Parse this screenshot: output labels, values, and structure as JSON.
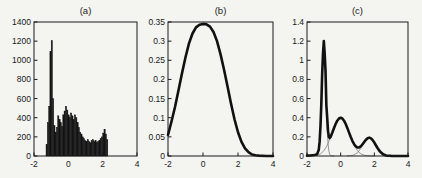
{
  "colors": {
    "paper": "#f4f4f1",
    "ink": "#1a1a1a",
    "bar_fill": "#141414",
    "thick_line": "#111111",
    "thin_line": "#6e6e6e"
  },
  "chart_data": [
    {
      "id": "a",
      "type": "bar",
      "title": "(a)",
      "xlabel": "",
      "ylabel": "",
      "xlim": [
        -2,
        4
      ],
      "ylim": [
        0,
        1400
      ],
      "grid": false,
      "legend": null,
      "xticks": {
        "values": [
          -2,
          0,
          2,
          4
        ],
        "labels": [
          "-2",
          "0",
          "2",
          "4"
        ]
      },
      "yticks": {
        "values": [
          0,
          200,
          400,
          600,
          800,
          1000,
          1200,
          1400
        ],
        "labels": [
          "0",
          "200",
          "400",
          "600",
          "800",
          "1000",
          "1200",
          "1400"
        ]
      },
      "bin_start": -1.3,
      "bin_width": 0.075,
      "values": [
        120,
        350,
        520,
        1090,
        1205,
        600,
        320,
        250,
        300,
        420,
        380,
        350,
        310,
        430,
        470,
        520,
        480,
        430,
        400,
        450,
        420,
        380,
        430,
        400,
        350,
        300,
        250,
        230,
        200,
        180,
        160,
        150,
        170,
        150,
        140,
        160,
        170,
        150,
        160,
        140,
        150,
        160,
        180,
        200,
        240,
        280,
        230,
        170
      ]
    },
    {
      "id": "b",
      "type": "line",
      "title": "(b)",
      "xlabel": "",
      "ylabel": "",
      "xlim": [
        -2,
        4
      ],
      "ylim": [
        0,
        0.35
      ],
      "grid": false,
      "legend": null,
      "xticks": {
        "values": [
          -2,
          0,
          2,
          4
        ],
        "labels": [
          "-2",
          "0",
          "2",
          "4"
        ]
      },
      "yticks": {
        "values": [
          0,
          0.05,
          0.1,
          0.15,
          0.2,
          0.25,
          0.3,
          0.35
        ],
        "labels": [
          "0",
          "0.05",
          "0.1",
          "0.15",
          "0.2",
          "0.25",
          "0.3",
          "0.35"
        ]
      },
      "series": [
        {
          "name": "smoothed-density",
          "role": "thick",
          "points": [
            [
              -2,
              0.055
            ],
            [
              -1.8,
              0.09
            ],
            [
              -1.6,
              0.128
            ],
            [
              -1.4,
              0.172
            ],
            [
              -1.2,
              0.216
            ],
            [
              -1.0,
              0.258
            ],
            [
              -0.8,
              0.294
            ],
            [
              -0.6,
              0.32
            ],
            [
              -0.4,
              0.336
            ],
            [
              -0.2,
              0.343
            ],
            [
              0,
              0.345
            ],
            [
              0.2,
              0.344
            ],
            [
              0.4,
              0.338
            ],
            [
              0.6,
              0.324
            ],
            [
              0.8,
              0.3
            ],
            [
              1.0,
              0.266
            ],
            [
              1.2,
              0.226
            ],
            [
              1.4,
              0.182
            ],
            [
              1.6,
              0.137
            ],
            [
              1.8,
              0.096
            ],
            [
              2.0,
              0.062
            ],
            [
              2.2,
              0.037
            ],
            [
              2.4,
              0.02
            ],
            [
              2.6,
              0.01
            ],
            [
              2.8,
              0.004
            ],
            [
              3.0,
              0.002
            ],
            [
              3.2,
              0.001
            ],
            [
              3.6,
              0
            ],
            [
              4,
              0
            ]
          ]
        }
      ]
    },
    {
      "id": "c",
      "type": "line",
      "title": "(c)",
      "xlabel": "",
      "ylabel": "",
      "xlim": [
        -2,
        4
      ],
      "ylim": [
        0,
        1.4
      ],
      "grid": false,
      "legend": null,
      "xticks": {
        "values": [
          -2,
          0,
          2,
          4
        ],
        "labels": [
          "-2",
          "0",
          "2",
          "4"
        ]
      },
      "yticks": {
        "values": [
          0,
          0.2,
          0.4,
          0.6,
          0.8,
          1,
          1.2,
          1.4
        ],
        "labels": [
          "0",
          "0.2",
          "0.4",
          "0.6",
          "0.8",
          "1",
          "1.2",
          "1.4"
        ]
      },
      "series": [
        {
          "name": "component-1",
          "role": "thin",
          "points": [
            [
              -1.4,
              0.004
            ],
            [
              -1.3,
              0.05
            ],
            [
              -1.25,
              0.131
            ],
            [
              -1.2,
              0.287
            ],
            [
              -1.15,
              0.52
            ],
            [
              -1.1,
              0.81
            ],
            [
              -1.05,
              1.05
            ],
            [
              -1.0,
              1.15
            ],
            [
              -0.95,
              1.05
            ],
            [
              -0.9,
              0.81
            ],
            [
              -0.85,
              0.52
            ],
            [
              -0.8,
              0.287
            ],
            [
              -0.75,
              0.131
            ],
            [
              -0.7,
              0.05
            ],
            [
              -0.65,
              0.016
            ],
            [
              -0.6,
              0.004
            ],
            [
              -0.5,
              0.001
            ],
            [
              -0.4,
              0
            ]
          ]
        },
        {
          "name": "component-2",
          "role": "thin",
          "points": [
            [
              -2,
              0
            ],
            [
              -1.8,
              0.001
            ],
            [
              -1.6,
              0.002
            ],
            [
              -1.4,
              0.008
            ],
            [
              -1.2,
              0.022
            ],
            [
              -1.0,
              0.054
            ],
            [
              -0.8,
              0.111
            ],
            [
              -0.6,
              0.195
            ],
            [
              -0.4,
              0.29
            ],
            [
              -0.2,
              0.369
            ],
            [
              0,
              0.4
            ],
            [
              0.2,
              0.369
            ],
            [
              0.4,
              0.29
            ],
            [
              0.6,
              0.195
            ],
            [
              0.8,
              0.111
            ],
            [
              1.0,
              0.054
            ],
            [
              1.2,
              0.022
            ],
            [
              1.4,
              0.008
            ],
            [
              1.6,
              0.002
            ],
            [
              1.8,
              0.001
            ],
            [
              2.0,
              0
            ]
          ]
        },
        {
          "name": "component-3",
          "role": "thin",
          "points": [
            [
              0.4,
              0.002
            ],
            [
              0.6,
              0.003
            ],
            [
              0.8,
              0.012
            ],
            [
              1.0,
              0.035
            ],
            [
              1.2,
              0.08
            ],
            [
              1.4,
              0.139
            ],
            [
              1.6,
              0.184
            ],
            [
              1.7,
              0.19
            ],
            [
              1.8,
              0.184
            ],
            [
              2.0,
              0.139
            ],
            [
              2.2,
              0.08
            ],
            [
              2.4,
              0.035
            ],
            [
              2.6,
              0.012
            ],
            [
              2.8,
              0.003
            ],
            [
              3.0,
              0.001
            ],
            [
              3.2,
              0
            ]
          ]
        },
        {
          "name": "mixture-density",
          "role": "thick",
          "points": [
            [
              -2,
              0.004
            ],
            [
              -1.9,
              0.005
            ],
            [
              -1.8,
              0.006
            ],
            [
              -1.7,
              0.008
            ],
            [
              -1.6,
              0.01
            ],
            [
              -1.5,
              0.013
            ],
            [
              -1.4,
              0.02
            ],
            [
              -1.3,
              0.066
            ],
            [
              -1.25,
              0.15
            ],
            [
              -1.2,
              0.31
            ],
            [
              -1.15,
              0.54
            ],
            [
              -1.1,
              0.85
            ],
            [
              -1.05,
              1.07
            ],
            [
              -1.0,
              1.2
            ],
            [
              -0.95,
              1.07
            ],
            [
              -0.9,
              0.89
            ],
            [
              -0.85,
              0.53
            ],
            [
              -0.8,
              0.4
            ],
            [
              -0.75,
              0.26
            ],
            [
              -0.7,
              0.2
            ],
            [
              -0.65,
              0.188
            ],
            [
              -0.6,
              0.199
            ],
            [
              -0.5,
              0.243
            ],
            [
              -0.4,
              0.29
            ],
            [
              -0.3,
              0.334
            ],
            [
              -0.2,
              0.369
            ],
            [
              -0.1,
              0.392
            ],
            [
              0,
              0.4
            ],
            [
              0.1,
              0.392
            ],
            [
              0.2,
              0.369
            ],
            [
              0.3,
              0.334
            ],
            [
              0.4,
              0.291
            ],
            [
              0.5,
              0.244
            ],
            [
              0.6,
              0.198
            ],
            [
              0.7,
              0.156
            ],
            [
              0.8,
              0.123
            ],
            [
              0.9,
              0.1
            ],
            [
              1.0,
              0.089
            ],
            [
              1.1,
              0.09
            ],
            [
              1.2,
              0.102
            ],
            [
              1.3,
              0.123
            ],
            [
              1.4,
              0.147
            ],
            [
              1.5,
              0.17
            ],
            [
              1.6,
              0.186
            ],
            [
              1.7,
              0.192
            ],
            [
              1.8,
              0.184
            ],
            [
              1.9,
              0.166
            ],
            [
              2.0,
              0.14
            ],
            [
              2.1,
              0.11
            ],
            [
              2.2,
              0.081
            ],
            [
              2.3,
              0.055
            ],
            [
              2.4,
              0.036
            ],
            [
              2.5,
              0.021
            ],
            [
              2.6,
              0.012
            ],
            [
              2.7,
              0.006
            ],
            [
              2.8,
              0.003
            ],
            [
              2.9,
              0.002
            ],
            [
              3.0,
              0.001
            ],
            [
              3.5,
              0
            ],
            [
              4,
              0
            ]
          ]
        }
      ]
    }
  ]
}
